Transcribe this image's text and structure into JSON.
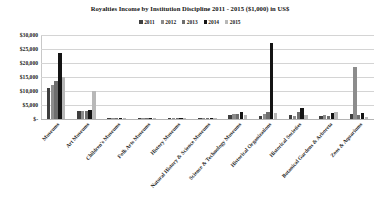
{
  "chart_data": {
    "type": "bar",
    "title": "Royalties Income by Institution Discipline 2011 - 2015 ($1,000) in US$",
    "xlabel": "",
    "ylabel": "",
    "ylim": [
      0,
      30000
    ],
    "grid": true,
    "legend_position": "top",
    "y_tick_labels": [
      "$30,000",
      "$25,000",
      "$20,000",
      "$15,000",
      "$10,000",
      "$5,000",
      "$-"
    ],
    "y_tick_values": [
      30000,
      25000,
      20000,
      15000,
      10000,
      5000,
      0
    ],
    "categories": [
      "Museums",
      "Art Museums",
      "Children's Museums",
      "Folk Arts Museums",
      "History Museums",
      "Natural History & Science Museums",
      "Science & Technology Museums",
      "Historical Organizations",
      "Historical Societies",
      "Botanical Gardens & Arboreta",
      "Zoos & Aquariums"
    ],
    "series": [
      {
        "name": "2011",
        "color": "#3f3f3f",
        "values": [
          11200,
          2700,
          260,
          120,
          90,
          70,
          1400,
          1100,
          1500,
          900,
          1800
        ]
      },
      {
        "name": "2012",
        "color": "#8c8c8c",
        "values": [
          12000,
          2900,
          300,
          140,
          110,
          90,
          1700,
          1900,
          1100,
          1400,
          18500
        ]
      },
      {
        "name": "2013",
        "color": "#6e6e6e",
        "values": [
          13400,
          2800,
          280,
          130,
          100,
          80,
          1900,
          2600,
          2400,
          1100,
          1500
        ]
      },
      {
        "name": "2014",
        "color": "#141414",
        "values": [
          23500,
          3100,
          320,
          150,
          120,
          110,
          2600,
          27000,
          3900,
          2200,
          2100
        ]
      },
      {
        "name": "2015",
        "color": "#b8b8b8",
        "values": [
          15000,
          9900,
          240,
          110,
          80,
          60,
          1300,
          2000,
          1600,
          2500,
          800
        ]
      }
    ]
  }
}
